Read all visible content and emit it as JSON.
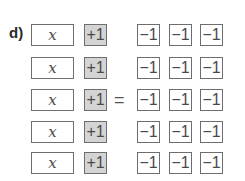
{
  "part_label": "d)",
  "equals_sign": "=",
  "rows": [
    {
      "x": "x",
      "plus": "+1",
      "minus": [
        "−1",
        "−1",
        "−1"
      ]
    },
    {
      "x": "x",
      "plus": "+1",
      "minus": [
        "−1",
        "−1",
        "−1"
      ]
    },
    {
      "x": "x",
      "plus": "+1",
      "minus": [
        "−1",
        "−1",
        "−1"
      ]
    },
    {
      "x": "x",
      "plus": "+1",
      "minus": [
        "−1",
        "−1",
        "−1"
      ]
    },
    {
      "x": "x",
      "plus": "+1",
      "minus": [
        "−1",
        "−1",
        "−1"
      ]
    }
  ],
  "colors": {
    "plus_tile_fill": "#d4d4d4",
    "border": "#6e6e6e"
  }
}
